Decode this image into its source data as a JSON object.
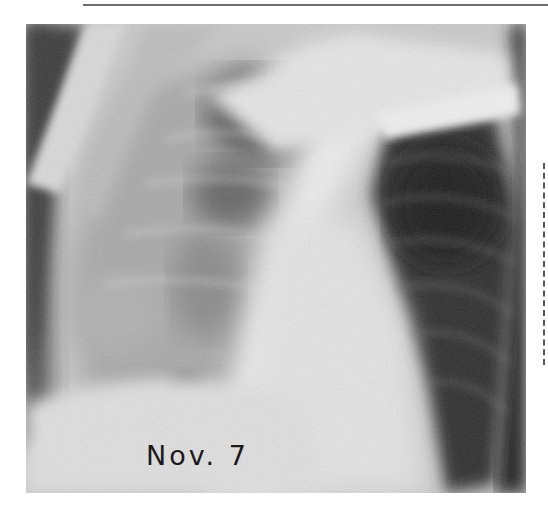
{
  "figure": {
    "type": "chest radiograph",
    "caption": "Nov. 7",
    "colors": {
      "background": "#ffffff",
      "film_light": "#e8e8e8",
      "film_dark": "#1c1c1c",
      "rule": "#6f6f6f"
    }
  }
}
